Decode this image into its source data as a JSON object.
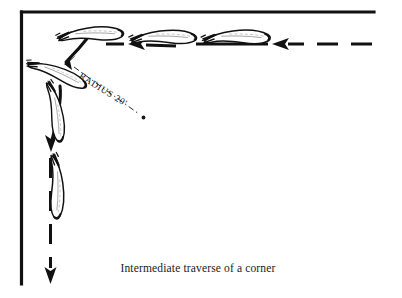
{
  "figure": {
    "title_caption": "Intermediate traverse of a corner",
    "annotations": {
      "radius_label": "RADIUS 20'"
    },
    "colors": {
      "ink": "#111111",
      "background": "#ffffff",
      "hull_fill": "#ffffff",
      "hull_detail": "#8a8a8a"
    },
    "walls": {
      "description": "corner-walls",
      "corner_point": [
        21,
        12
      ],
      "top_wall_end_x": 374,
      "left_wall_end_y": 284
    },
    "path": {
      "description": "travel-path-with-arrows",
      "direction": "right-to-left-then-down",
      "segments": [
        {
          "name": "dashed-incoming-top",
          "from": [
            372,
            44
          ],
          "to": [
            286,
            44
          ],
          "style": "dashed"
        },
        {
          "name": "arrowhead-top-right",
          "at": [
            272,
            44
          ],
          "points": "left"
        },
        {
          "name": "solid-top-mid",
          "from": [
            268,
            44
          ],
          "to": [
            196,
            44
          ],
          "style": "solid"
        },
        {
          "name": "arrowhead-top-mid",
          "at": [
            128,
            44
          ],
          "points": "left"
        },
        {
          "name": "solid-top-left",
          "from": [
            124,
            44
          ],
          "to": [
            104,
            44
          ],
          "style": "solid"
        },
        {
          "name": "curved-arrow-corner-1",
          "from": [
            88,
            36
          ],
          "to": [
            62,
            66
          ],
          "style": "curved-solid"
        },
        {
          "name": "curved-arrow-corner-2",
          "from": [
            58,
            88
          ],
          "to": [
            50,
            146
          ],
          "style": "curved-solid"
        },
        {
          "name": "dashed-outgoing-down",
          "from": [
            50,
            160
          ],
          "to": [
            50,
            272
          ],
          "style": "dashed"
        },
        {
          "name": "arrowhead-bottom",
          "at": [
            50,
            282
          ],
          "points": "down"
        }
      ]
    },
    "radius_leader": {
      "name": "radius-leader-line",
      "style": "dash-dot",
      "from": [
        74,
        66
      ],
      "to": [
        141,
        115
      ],
      "center_dot": [
        143,
        117
      ]
    },
    "vehicles": [
      {
        "name": "hull-top-right",
        "position": [
          235,
          36
        ],
        "rotation": -8,
        "label": ""
      },
      {
        "name": "hull-top-mid",
        "position": [
          163,
          36
        ],
        "rotation": -8,
        "label": ""
      },
      {
        "name": "hull-top-left",
        "position": [
          88,
          34
        ],
        "rotation": -10,
        "label": ""
      },
      {
        "name": "hull-corner-diagonal",
        "position": [
          56,
          72
        ],
        "rotation": 18,
        "label": ""
      },
      {
        "name": "hull-left-upper",
        "position": [
          55,
          110
        ],
        "rotation": 72,
        "label": ""
      },
      {
        "name": "hull-left-lower",
        "position": [
          55,
          185
        ],
        "rotation": 80,
        "label": ""
      }
    ],
    "legend": {
      "hull_count": 6,
      "arrow_count": 3
    }
  }
}
